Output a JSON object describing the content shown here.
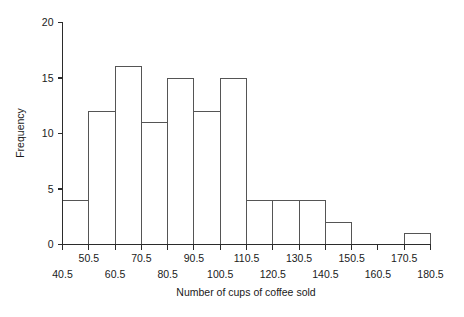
{
  "chart_data": {
    "type": "bar",
    "title": "",
    "xlabel": "Number of cups of coffee sold",
    "ylabel": "Frequency",
    "bin_width": 10,
    "bin_edges": [
      40.5,
      50.5,
      60.5,
      70.5,
      80.5,
      90.5,
      100.5,
      110.5,
      120.5,
      130.5,
      140.5,
      150.5,
      160.5,
      170.5,
      180.5
    ],
    "categories": [
      "40.5-50.5",
      "50.5-60.5",
      "60.5-70.5",
      "70.5-80.5",
      "80.5-90.5",
      "90.5-100.5",
      "100.5-110.5",
      "110.5-120.5",
      "120.5-130.5",
      "130.5-140.5",
      "140.5-150.5",
      "150.5-160.5",
      "160.5-170.5",
      "170.5-180.5"
    ],
    "values": [
      4,
      12,
      16,
      11,
      15,
      12,
      15,
      4,
      4,
      4,
      2,
      0,
      0,
      1
    ],
    "xlim": [
      40.5,
      180.5
    ],
    "ylim": [
      0,
      20
    ],
    "ytick_values": [
      0,
      5,
      10,
      15,
      20
    ],
    "ytick_labels": [
      "0",
      "5",
      "10",
      "15",
      "20"
    ],
    "xtick_values": [
      40.5,
      50.5,
      60.5,
      70.5,
      80.5,
      90.5,
      100.5,
      110.5,
      120.5,
      130.5,
      140.5,
      150.5,
      160.5,
      170.5,
      180.5
    ],
    "xtick_labels_upper": [
      {
        "value": 50.5,
        "label": "50.5"
      },
      {
        "value": 70.5,
        "label": "70.5"
      },
      {
        "value": 90.5,
        "label": "90.5"
      },
      {
        "value": 110.5,
        "label": "110.5"
      },
      {
        "value": 130.5,
        "label": "130.5"
      },
      {
        "value": 150.5,
        "label": "150.5"
      },
      {
        "value": 170.5,
        "label": "170.5"
      }
    ],
    "xtick_labels_lower": [
      {
        "value": 40.5,
        "label": "40.5"
      },
      {
        "value": 60.5,
        "label": "60.5"
      },
      {
        "value": 80.5,
        "label": "80.5"
      },
      {
        "value": 100.5,
        "label": "100.5"
      },
      {
        "value": 120.5,
        "label": "120.5"
      },
      {
        "value": 140.5,
        "label": "140.5"
      },
      {
        "value": 160.5,
        "label": "160.5"
      },
      {
        "value": 180.5,
        "label": "180.5"
      }
    ],
    "grid": false,
    "legend": null,
    "colors": {
      "bar_stroke": "#555555",
      "bar_fill": "none",
      "axis": "#2b2b2b",
      "text": "#1a1a1a",
      "background": "#ffffff"
    }
  }
}
